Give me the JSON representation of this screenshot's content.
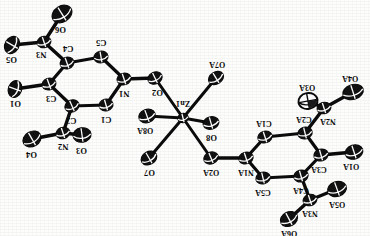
{
  "figure": {
    "kind": "ortep-crystal-structure",
    "orientation_note": "180-rotated",
    "stroke_color": "#0b0b0b",
    "fill_color": "#111111",
    "background": "#fdfdfc",
    "canvas": {
      "width": 370,
      "height": 236
    }
  },
  "atoms": [
    {
      "id": "O6",
      "label": "O6",
      "x": 62,
      "y": 14,
      "rx": 10.5,
      "ry": 8.0,
      "rot": -32,
      "fill": "solid",
      "label_dx": -2,
      "label_dy": 15
    },
    {
      "id": "N3",
      "label": "N3",
      "x": 44,
      "y": 42,
      "rx": 7.0,
      "ry": 5.6,
      "rot": -18,
      "fill": "solid",
      "label_dx": -3,
      "label_dy": 12
    },
    {
      "id": "O5",
      "label": "O5",
      "x": 12,
      "y": 45,
      "rx": 9.0,
      "ry": 7.0,
      "rot": -60,
      "fill": "solid",
      "label_dx": -1,
      "label_dy": 14
    },
    {
      "id": "C4",
      "label": "C4",
      "x": 67,
      "y": 63,
      "rx": 7.0,
      "ry": 5.8,
      "rot": -20,
      "fill": "solid",
      "label_dx": 1,
      "label_dy": -15
    },
    {
      "id": "C5",
      "label": "C5",
      "x": 101,
      "y": 57,
      "rx": 7.0,
      "ry": 5.8,
      "rot": -10,
      "fill": "solid",
      "label_dx": 0,
      "label_dy": -15
    },
    {
      "id": "N1",
      "label": "N1",
      "x": 124,
      "y": 79,
      "rx": 7.0,
      "ry": 5.8,
      "rot": -18,
      "fill": "solid",
      "label_dx": 0,
      "label_dy": 14
    },
    {
      "id": "C1",
      "label": "C1",
      "x": 106,
      "y": 105,
      "rx": 7.0,
      "ry": 5.8,
      "rot": -16,
      "fill": "solid",
      "label_dx": 0,
      "label_dy": 14
    },
    {
      "id": "C2",
      "label": "C2",
      "x": 72,
      "y": 106,
      "rx": 7.2,
      "ry": 6.0,
      "rot": -24,
      "fill": "solid",
      "label_dx": -1,
      "label_dy": 14
    },
    {
      "id": "C3",
      "label": "C3",
      "x": 49,
      "y": 84,
      "rx": 7.0,
      "ry": 5.8,
      "rot": -20,
      "fill": "solid",
      "label_dx": 2,
      "label_dy": 14
    },
    {
      "id": "O1",
      "label": "O1",
      "x": 15,
      "y": 89,
      "rx": 8.5,
      "ry": 6.6,
      "rot": -70,
      "fill": "solid",
      "label_dx": 0,
      "label_dy": 14
    },
    {
      "id": "N2",
      "label": "N2",
      "x": 63,
      "y": 133,
      "rx": 7.0,
      "ry": 5.6,
      "rot": -18,
      "fill": "solid",
      "label_dx": 0,
      "label_dy": 13
    },
    {
      "id": "O3",
      "label": "O3",
      "x": 82,
      "y": 135,
      "rx": 9.0,
      "ry": 7.2,
      "rot": -8,
      "fill": "solid",
      "label_dx": -1,
      "label_dy": 15
    },
    {
      "id": "O4",
      "label": "O4",
      "x": 32,
      "y": 139,
      "rx": 9.5,
      "ry": 7.4,
      "rot": -30,
      "fill": "solid",
      "label_dx": -1,
      "label_dy": 15
    },
    {
      "id": "O2",
      "label": "O2",
      "x": 155,
      "y": 78,
      "rx": 7.4,
      "ry": 5.8,
      "rot": -26,
      "fill": "solid",
      "label_dx": 2,
      "label_dy": 14
    },
    {
      "id": "Zn1",
      "label": "Zn1",
      "x": 183,
      "y": 118,
      "rx": 5.2,
      "ry": 4.6,
      "rot": -14,
      "fill": "solid",
      "label_dx": 0,
      "label_dy": -15
    },
    {
      "id": "O7A",
      "label": "O7A",
      "x": 216,
      "y": 78,
      "rx": 8.0,
      "ry": 6.0,
      "rot": -32,
      "fill": "solid",
      "label_dx": 1,
      "label_dy": -14
    },
    {
      "id": "O8",
      "label": "O8",
      "x": 211,
      "y": 123,
      "rx": 8.0,
      "ry": 6.2,
      "rot": -16,
      "fill": "solid",
      "label_dx": 0,
      "label_dy": 14
    },
    {
      "id": "O8A",
      "label": "O8A",
      "x": 147,
      "y": 116,
      "rx": 8.4,
      "ry": 6.6,
      "rot": -20,
      "fill": "solid",
      "label_dx": -2,
      "label_dy": 14
    },
    {
      "id": "O7",
      "label": "O7",
      "x": 149,
      "y": 158,
      "rx": 8.2,
      "ry": 6.4,
      "rot": -30,
      "fill": "solid",
      "label_dx": 0,
      "label_dy": 14
    },
    {
      "id": "O2A",
      "label": "O2A",
      "x": 211,
      "y": 158,
      "rx": 7.4,
      "ry": 5.8,
      "rot": -22,
      "fill": "solid",
      "label_dx": 0,
      "label_dy": 14
    },
    {
      "id": "N1A",
      "label": "N1A",
      "x": 246,
      "y": 158,
      "rx": 7.2,
      "ry": 5.8,
      "rot": -18,
      "fill": "solid",
      "label_dx": 0,
      "label_dy": 14
    },
    {
      "id": "C1A",
      "label": "C1A",
      "x": 265,
      "y": 137,
      "rx": 7.2,
      "ry": 5.8,
      "rot": -18,
      "fill": "solid",
      "label_dx": -1,
      "label_dy": -14
    },
    {
      "id": "C2A",
      "label": "C2A",
      "x": 305,
      "y": 133,
      "rx": 7.2,
      "ry": 5.8,
      "rot": -14,
      "fill": "solid",
      "label_dx": -1,
      "label_dy": -14
    },
    {
      "id": "C3A",
      "label": "C3A",
      "x": 321,
      "y": 155,
      "rx": 7.2,
      "ry": 5.8,
      "rot": -16,
      "fill": "solid",
      "label_dx": -2,
      "label_dy": 14
    },
    {
      "id": "C4A",
      "label": "C4A",
      "x": 301,
      "y": 176,
      "rx": 7.2,
      "ry": 5.8,
      "rot": -16,
      "fill": "solid",
      "label_dx": 0,
      "label_dy": 14
    },
    {
      "id": "C5A",
      "label": "C5A",
      "x": 263,
      "y": 178,
      "rx": 7.2,
      "ry": 5.8,
      "rot": -14,
      "fill": "solid",
      "label_dx": 0,
      "label_dy": 14
    },
    {
      "id": "N2A",
      "label": "N2A",
      "x": 324,
      "y": 108,
      "rx": 7.0,
      "ry": 5.6,
      "rot": -18,
      "fill": "solid",
      "label_dx": 4,
      "label_dy": 13
    },
    {
      "id": "O3A",
      "label": "O3A",
      "x": 308,
      "y": 101,
      "rx": 9.6,
      "ry": 8.0,
      "rot": -10,
      "fill": "open",
      "label_dx": -1,
      "label_dy": -14
    },
    {
      "id": "O4A",
      "label": "O4A",
      "x": 353,
      "y": 92,
      "rx": 10.5,
      "ry": 7.4,
      "rot": -18,
      "fill": "solid",
      "label_dx": -3,
      "label_dy": -14
    },
    {
      "id": "O1A",
      "label": "O1A",
      "x": 354,
      "y": 152,
      "rx": 9.0,
      "ry": 7.0,
      "rot": -18,
      "fill": "solid",
      "label_dx": -3,
      "label_dy": 14
    },
    {
      "id": "N3A",
      "label": "N3A",
      "x": 310,
      "y": 200,
      "rx": 7.0,
      "ry": 5.6,
      "rot": -18,
      "fill": "solid",
      "label_dx": 0,
      "label_dy": 13
    },
    {
      "id": "O5A",
      "label": "O5A",
      "x": 337,
      "y": 189,
      "rx": 9.6,
      "ry": 7.4,
      "rot": -20,
      "fill": "solid",
      "label_dx": 0,
      "label_dy": 15
    },
    {
      "id": "O6A",
      "label": "O6A",
      "x": 289,
      "y": 219,
      "rx": 9.0,
      "ry": 7.0,
      "rot": -28,
      "fill": "solid",
      "label_dx": 0,
      "label_dy": 14
    }
  ],
  "bonds": [
    {
      "a": "O6",
      "b": "N3",
      "w": 3.4
    },
    {
      "a": "O5",
      "b": "N3",
      "w": 3.4
    },
    {
      "a": "N3",
      "b": "C4",
      "w": 3.4
    },
    {
      "a": "C4",
      "b": "C5",
      "w": 3.2
    },
    {
      "a": "C5",
      "b": "N1",
      "w": 3.2
    },
    {
      "a": "N1",
      "b": "C1",
      "w": 3.2
    },
    {
      "a": "C1",
      "b": "C2",
      "w": 3.2
    },
    {
      "a": "C2",
      "b": "C3",
      "w": 3.2
    },
    {
      "a": "C3",
      "b": "C4",
      "w": 3.2
    },
    {
      "a": "C3",
      "b": "O1",
      "w": 3.4
    },
    {
      "a": "C2",
      "b": "N2",
      "w": 3.4
    },
    {
      "a": "N2",
      "b": "O3",
      "w": 3.4
    },
    {
      "a": "N2",
      "b": "O4",
      "w": 3.4
    },
    {
      "a": "N1",
      "b": "O2",
      "w": 3.4
    },
    {
      "a": "O2",
      "b": "Zn1",
      "w": 3.0
    },
    {
      "a": "Zn1",
      "b": "O7A",
      "w": 3.0
    },
    {
      "a": "Zn1",
      "b": "O8",
      "w": 3.0
    },
    {
      "a": "Zn1",
      "b": "O8A",
      "w": 3.0
    },
    {
      "a": "Zn1",
      "b": "O7",
      "w": 3.0
    },
    {
      "a": "Zn1",
      "b": "O2A",
      "w": 3.0
    },
    {
      "a": "O2A",
      "b": "N1A",
      "w": 3.4
    },
    {
      "a": "N1A",
      "b": "C1A",
      "w": 3.2
    },
    {
      "a": "C1A",
      "b": "C2A",
      "w": 3.2
    },
    {
      "a": "C2A",
      "b": "C3A",
      "w": 3.2
    },
    {
      "a": "C3A",
      "b": "C4A",
      "w": 3.2
    },
    {
      "a": "C4A",
      "b": "C5A",
      "w": 3.2
    },
    {
      "a": "C5A",
      "b": "N1A",
      "w": 3.2
    },
    {
      "a": "C2A",
      "b": "N2A",
      "w": 3.4
    },
    {
      "a": "N2A",
      "b": "O3A",
      "w": 3.4
    },
    {
      "a": "N2A",
      "b": "O4A",
      "w": 3.4
    },
    {
      "a": "C3A",
      "b": "O1A",
      "w": 3.4
    },
    {
      "a": "C4A",
      "b": "N3A",
      "w": 3.4
    },
    {
      "a": "N3A",
      "b": "O5A",
      "w": 3.4
    },
    {
      "a": "N3A",
      "b": "O6A",
      "w": 3.4
    }
  ]
}
